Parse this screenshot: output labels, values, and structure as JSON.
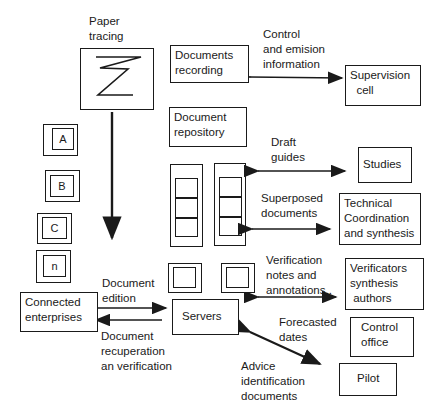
{
  "diagram": {
    "nodes": {
      "paper_tracing_label": "Paper\ntracing",
      "documents_recording": "Documents\nrecording",
      "supervision_cell": "Supervision\n  cell",
      "document_repository": "Document\nrepository",
      "studies": "Studies",
      "technical_coordination": "Technical\nCoordination\nand synthesis",
      "verificators": "Verificators\nsynthesis\n authors",
      "control_office": "Control\noffice",
      "pilot": "Pilot",
      "servers": "Servers",
      "connected_enterprises": "Connected\nenterprises"
    },
    "stack_items": [
      "A",
      "B",
      "C",
      "n"
    ],
    "edge_labels": {
      "control_emision": "Control\nand emision\ninformation",
      "draft_guides": "Draft\nguides",
      "superposed_documents": "Superposed\ndocuments",
      "verification_notes": "Verification\nnotes and\nannotations..",
      "document_edition": "Document\nedition",
      "document_recuperation": "Document\nrecuperation\nan verification",
      "forecasted_dates": "Forecasted\ndates",
      "advice_identification": "Advice\nidentification\ndocuments"
    },
    "colors": {
      "line": "#1a1a1a",
      "background": "#ffffff"
    }
  }
}
